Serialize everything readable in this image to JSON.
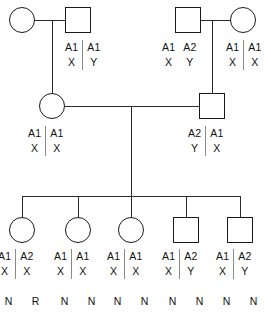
{
  "diagram": {
    "line_color": "#2b2b2b",
    "symbol_color": "#1a1a1a",
    "separator_color": "#8a8a8a"
  },
  "generation1": {
    "couple_left": {
      "mother": {
        "sex": "female",
        "genotype": null
      },
      "father": {
        "sex": "male",
        "alleles": [
          "A1",
          "A1"
        ],
        "sex_chromosomes": [
          "X",
          "Y"
        ],
        "separator": true
      }
    },
    "couple_right": {
      "father": {
        "sex": "male",
        "alleles": [
          "A1",
          "A2"
        ],
        "sex_chromosomes": [
          "X",
          "Y"
        ],
        "separator": false
      },
      "mother": {
        "sex": "female",
        "alleles": [
          "A1",
          "A1"
        ],
        "sex_chromosomes": [
          "X",
          "X"
        ],
        "separator": true
      }
    }
  },
  "generation2": {
    "mother": {
      "sex": "female",
      "alleles": [
        "A1",
        "A1"
      ],
      "sex_chromosomes": [
        "X",
        "X"
      ],
      "separator": true
    },
    "father": {
      "sex": "male",
      "alleles": [
        "A2",
        "A1"
      ],
      "sex_chromosomes": [
        "Y",
        "X"
      ],
      "separator": true
    }
  },
  "generation3": {
    "children": [
      {
        "sex": "female",
        "alleles": [
          "A1",
          "A2"
        ],
        "sex_chromosomes": [
          "X",
          "X"
        ],
        "separator": true,
        "phenotypes": [
          "N",
          "R"
        ]
      },
      {
        "sex": "female",
        "alleles": [
          "A1",
          "A1"
        ],
        "sex_chromosomes": [
          "X",
          "X"
        ],
        "separator": true,
        "phenotypes": [
          "N",
          "N"
        ]
      },
      {
        "sex": "female",
        "alleles": [
          "A1",
          "A1"
        ],
        "sex_chromosomes": [
          "X",
          "X"
        ],
        "separator": true,
        "phenotypes": [
          "N",
          "N"
        ]
      },
      {
        "sex": "male",
        "alleles": [
          "A1",
          "A2"
        ],
        "sex_chromosomes": [
          "X",
          "Y"
        ],
        "separator": true,
        "phenotypes": [
          "N",
          "N"
        ]
      },
      {
        "sex": "male",
        "alleles": [
          "A1",
          "A2"
        ],
        "sex_chromosomes": [
          "X",
          "Y"
        ],
        "separator": true,
        "phenotypes": [
          "N",
          "N"
        ]
      }
    ]
  }
}
